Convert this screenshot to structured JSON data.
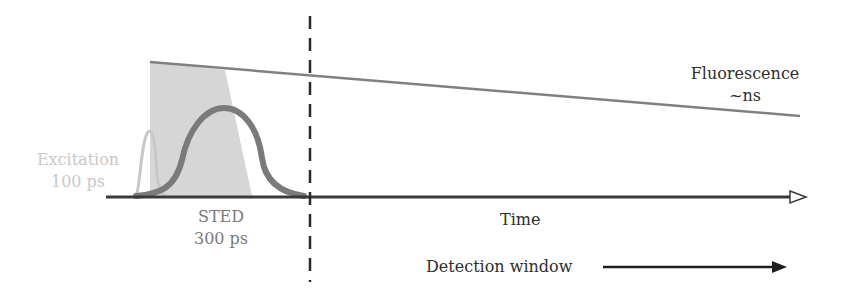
{
  "diagram": {
    "labels": {
      "excitation": {
        "line1": "Excitation",
        "line2": "100 ps"
      },
      "sted": {
        "line1": "STED",
        "line2": "300 ps"
      },
      "fluorescence": {
        "line1": "Fluorescence",
        "line2": "~ns"
      },
      "time_axis": "Time",
      "detection": "Detection window"
    },
    "colors": {
      "excitation_pulse": "#c8c8c8",
      "excitation_text": "#c8c8c8",
      "sted_pulse": "#7a7a7a",
      "sted_text": "#7a7a7a",
      "depletion_region": "#d6d6d6",
      "fluorescence_line": "#808080",
      "axis": "#3a3a3a",
      "dashed_gate": "#2a2a2a",
      "text": "#2e2e2e"
    },
    "elements": [
      "excitation pulse (narrow, light grey)",
      "STED pulse (broad, dark grey)",
      "shaded depletion region",
      "fluorescence decay line",
      "time axis with open arrowhead",
      "dashed time gate line",
      "detection window arrow"
    ]
  }
}
